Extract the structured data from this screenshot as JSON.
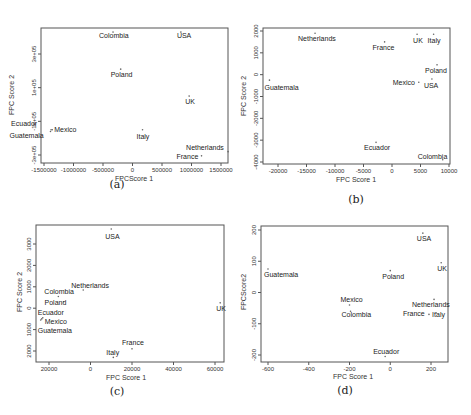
{
  "chart_data": [
    {
      "panel": "(a)",
      "type": "scatter",
      "xlabel": "FPCScore 1",
      "ylabel": "FPC Score 2",
      "xticks": [
        -1500000,
        -1000000,
        -500000,
        0,
        500000,
        1000000,
        1500000
      ],
      "xtick_labels": [
        "-1500000",
        "-1000000",
        "-500000",
        "0",
        "500000",
        "1000000",
        "1500000"
      ],
      "yticks": [
        300000,
        100000,
        -100000,
        -300000
      ],
      "ytick_labels": [
        "3e+05",
        "1e+05",
        "-1e+05",
        "-3e+05"
      ],
      "xlim": [
        -1550000,
        1650000
      ],
      "ylim": [
        -330000,
        460000
      ],
      "points": [
        {
          "label": "Colombia",
          "x": -330000,
          "y": 430000
        },
        {
          "label": "USA",
          "x": 820000,
          "y": 430000
        },
        {
          "label": "Poland",
          "x": -200000,
          "y": 210000
        },
        {
          "label": "UK",
          "x": 960000,
          "y": 50000
        },
        {
          "label": "Ecuador",
          "x": -1380000,
          "y": -150000
        },
        {
          "label": "Mexico",
          "x": -1360000,
          "y": -150000
        },
        {
          "label": "Guatemala",
          "x": -1390000,
          "y": -160000
        },
        {
          "label": "Italy",
          "x": 170000,
          "y": -150000
        },
        {
          "label": "Netherlands",
          "x": 1620000,
          "y": -280000
        },
        {
          "label": "France",
          "x": 1170000,
          "y": -305000
        }
      ],
      "caption": "(a)"
    },
    {
      "panel": "(b)",
      "type": "scatter",
      "xlabel": "FPC Score 1",
      "ylabel": "FPC Score 2",
      "xticks": [
        -20000,
        -15000,
        -10000,
        -5000,
        0,
        5000,
        10000
      ],
      "xtick_labels": [
        "-20000",
        "-15000",
        "-10000",
        "-5000",
        "0",
        "5000",
        "10000"
      ],
      "yticks": [
        2000,
        1000,
        0,
        -1000,
        -2000,
        -3000,
        -4000
      ],
      "ytick_labels": [
        "2000",
        "1000",
        "0",
        "-1000",
        "-2000",
        "-3000",
        "-4000"
      ],
      "xlim": [
        -23000,
        10000
      ],
      "ylim": [
        -4100,
        2150
      ],
      "points": [
        {
          "label": "Netherlands",
          "x": -13500,
          "y": 1900
        },
        {
          "label": "France",
          "x": -1300,
          "y": 1500
        },
        {
          "label": "UK",
          "x": 4400,
          "y": 1850
        },
        {
          "label": "Italy",
          "x": 7300,
          "y": 1850
        },
        {
          "label": "Poland",
          "x": 7900,
          "y": 450
        },
        {
          "label": "Mexico",
          "x": 4700,
          "y": -350
        },
        {
          "label": "USA",
          "x": 7000,
          "y": -200
        },
        {
          "label": "Guatemala",
          "x": -21500,
          "y": -250
        },
        {
          "label": "Ecuador",
          "x": -2800,
          "y": -3100
        },
        {
          "label": "Colombia",
          "x": 8900,
          "y": -3900
        }
      ],
      "caption": "(b)"
    },
    {
      "panel": "(c)",
      "type": "scatter",
      "xlabel": "FPC Score 1",
      "ylabel": "FPC Score 2",
      "xticks": [
        -20000,
        0,
        20000,
        40000,
        60000
      ],
      "xtick_labels": [
        "20000",
        "0",
        "20000",
        "40000",
        "60000"
      ],
      "yticks": [
        3000,
        2000,
        1000,
        0,
        -1000,
        -2000
      ],
      "ytick_labels": [
        "3000",
        "2000",
        "1000",
        "0",
        "1000",
        "2000"
      ],
      "xlim": [
        -26000,
        64000
      ],
      "ylim": [
        -2400,
        3800
      ],
      "points": [
        {
          "label": "USA",
          "x": 10000,
          "y": 3700
        },
        {
          "label": "Netherlands",
          "x": -3500,
          "y": 850
        },
        {
          "label": "Colombia",
          "x": -15500,
          "y": 550
        },
        {
          "label": "Poland",
          "x": -13000,
          "y": 300
        },
        {
          "label": "UK",
          "x": 62500,
          "y": 250
        },
        {
          "label": "Ecuador",
          "x": -23000,
          "y": -450
        },
        {
          "label": "Mexico",
          "x": -23500,
          "y": -500
        },
        {
          "label": "Guatemala",
          "x": -24000,
          "y": -550
        },
        {
          "label": "France",
          "x": 20000,
          "y": -1900
        },
        {
          "label": "Italy",
          "x": 11000,
          "y": -2300
        }
      ],
      "caption": "(c)"
    },
    {
      "panel": "(d)",
      "type": "scatter",
      "xlabel": "FPC Score 1",
      "ylabel": "FPCScore2",
      "xticks": [
        -600,
        -400,
        -200,
        0,
        200
      ],
      "xtick_labels": [
        "-600",
        "-400",
        "-200",
        "0",
        "200"
      ],
      "yticks": [
        200,
        100,
        0,
        -100,
        -200
      ],
      "ytick_labels": [
        "200",
        "100",
        "0",
        "-100",
        "-200"
      ],
      "xlim": [
        -630,
        280
      ],
      "ylim": [
        -215,
        210
      ],
      "points": [
        {
          "label": "USA",
          "x": 160,
          "y": 190
        },
        {
          "label": "UK",
          "x": 250,
          "y": 95
        },
        {
          "label": "Guatemala",
          "x": -600,
          "y": 75
        },
        {
          "label": "Poland",
          "x": 0,
          "y": 70
        },
        {
          "label": "Mexico",
          "x": -200,
          "y": -40
        },
        {
          "label": "Colombia",
          "x": -195,
          "y": -60
        },
        {
          "label": "Netherlands",
          "x": 215,
          "y": -22
        },
        {
          "label": "France",
          "x": 190,
          "y": -70
        },
        {
          "label": "Italy",
          "x": 225,
          "y": -65
        },
        {
          "label": "Ecuador",
          "x": -25,
          "y": -205
        }
      ],
      "caption": "(d)"
    }
  ]
}
